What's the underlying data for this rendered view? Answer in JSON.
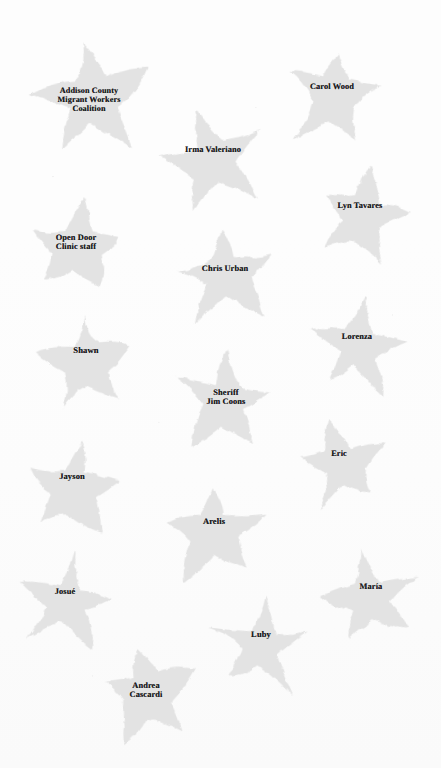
{
  "page": {
    "background_color": "#fdfdfd",
    "star_fill_color": "#e3e3e3",
    "label_text_color": "#18181a",
    "width": 441,
    "height": 768
  },
  "stars": [
    {
      "id": "addison-county-migrant-workers-coalition",
      "label": "Addison County\nMigrant Workers\nCoalition",
      "x": 89,
      "y": 100,
      "size": 128,
      "rotation": -6,
      "font_size": 8.2,
      "label_offset_x": 0,
      "label_offset_y": 0,
      "seed": 1
    },
    {
      "id": "carol-wood",
      "label": "Carol Wood",
      "x": 334,
      "y": 98,
      "size": 108,
      "rotation": 8,
      "font_size": 8.4,
      "label_offset_x": -2,
      "label_offset_y": -2,
      "seed": 2
    },
    {
      "id": "irma-valeriano",
      "label": "Irma Valeriano",
      "x": 214,
      "y": 162,
      "size": 108,
      "rotation": -14,
      "font_size": 8.4,
      "label_offset_x": -1,
      "label_offset_y": -3,
      "seed": 3
    },
    {
      "id": "lyn-tavares",
      "label": "Lyn Tavares",
      "x": 363,
      "y": 218,
      "size": 106,
      "rotation": 14,
      "font_size": 8.4,
      "label_offset_x": -3,
      "label_offset_y": -3,
      "seed": 4
    },
    {
      "id": "open-door-clinic-staff",
      "label": "Open Door\nClinic staff",
      "x": 76,
      "y": 248,
      "size": 110,
      "rotation": 5,
      "font_size": 8.4,
      "label_offset_x": 0,
      "label_offset_y": -1,
      "seed": 5
    },
    {
      "id": "chris-urban",
      "label": "Chris Urban",
      "x": 226,
      "y": 278,
      "size": 110,
      "rotation": -8,
      "font_size": 8.4,
      "label_offset_x": -1,
      "label_offset_y": 0,
      "seed": 6
    },
    {
      "id": "shawn",
      "label": "Shawn",
      "x": 87,
      "y": 362,
      "size": 112,
      "rotation": -3,
      "font_size": 8.6,
      "label_offset_x": -1,
      "label_offset_y": -2,
      "seed": 7
    },
    {
      "id": "lorenza",
      "label": "Lorenza",
      "x": 358,
      "y": 348,
      "size": 104,
      "rotation": 10,
      "font_size": 8.4,
      "label_offset_x": -1,
      "label_offset_y": -2,
      "seed": 8
    },
    {
      "id": "sheriff-jim-coons",
      "label": "Sheriff\nJim Coons",
      "x": 226,
      "y": 402,
      "size": 110,
      "rotation": 4,
      "font_size": 8.4,
      "label_offset_x": 0,
      "label_offset_y": 0,
      "seed": 9
    },
    {
      "id": "eric",
      "label": "Eric",
      "x": 341,
      "y": 465,
      "size": 102,
      "rotation": -10,
      "font_size": 8.4,
      "label_offset_x": -2,
      "label_offset_y": -2,
      "seed": 10
    },
    {
      "id": "jayson",
      "label": "Jayson",
      "x": 73,
      "y": 488,
      "size": 112,
      "rotation": 6,
      "font_size": 8.5,
      "label_offset_x": -1,
      "label_offset_y": -2,
      "seed": 11
    },
    {
      "id": "arelis",
      "label": "Arelis",
      "x": 215,
      "y": 533,
      "size": 110,
      "rotation": -6,
      "font_size": 8.5,
      "label_offset_x": -1,
      "label_offset_y": -2,
      "seed": 12
    },
    {
      "id": "josue",
      "label": "Josué",
      "x": 66,
      "y": 603,
      "size": 106,
      "rotation": 9,
      "font_size": 8.4,
      "label_offset_x": -1,
      "label_offset_y": -2,
      "seed": 13
    },
    {
      "id": "maria",
      "label": "María",
      "x": 372,
      "y": 598,
      "size": 104,
      "rotation": -12,
      "font_size": 8.4,
      "label_offset_x": -1,
      "label_offset_y": -2,
      "seed": 14
    },
    {
      "id": "luby",
      "label": "Luby",
      "x": 262,
      "y": 646,
      "size": 110,
      "rotation": 7,
      "font_size": 8.5,
      "label_offset_x": -1,
      "label_offset_y": -2,
      "seed": 15
    },
    {
      "id": "andrea-cascardi",
      "label": "Andrea\nCascardi",
      "x": 147,
      "y": 695,
      "size": 108,
      "rotation": -5,
      "font_size": 8.4,
      "label_offset_x": -1,
      "label_offset_y": 0,
      "seed": 16
    }
  ]
}
